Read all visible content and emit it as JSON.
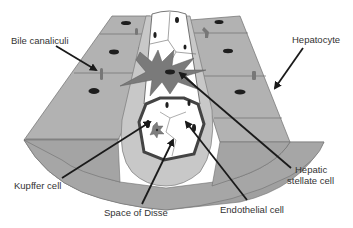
{
  "diagram": {
    "type": "anatomical-illustration",
    "colors": {
      "hepatocyte_fill": "#a8a8a8",
      "hepatocyte_top": "#b4b4b4",
      "hepatocyte_edge": "#6e6e6e",
      "space_of_disse": "#c8c8c8",
      "sinusoid_lumen": "#ffffff",
      "stellate_cell": "#7a7a7a",
      "nucleus": "#1e1e1e",
      "arrow": "#1a1a1a",
      "label_text": "#333333"
    },
    "labels": {
      "bile_canaliculi": "Bile canaliculi",
      "hepatocyte": "Hepatocyte",
      "hepatic_stellate_cell_line1": "Hepatic",
      "hepatic_stellate_cell_line2": "stellate cell",
      "kupffer_cell": "Kupffer cell",
      "space_of_disse": "Space of Disse",
      "endothelial_cell": "Endothelial cell"
    },
    "arrows": [
      {
        "from": "Bile canaliculi",
        "to": "bile canaliculus on left hepatocyte plate"
      },
      {
        "from": "Hepatocyte",
        "to": "right hepatocyte plate"
      },
      {
        "from": "Hepatic stellate cell",
        "to": "stellate cell in space of Disse"
      },
      {
        "from": "Kupffer cell",
        "to": "Kupffer cell inside sinusoid lumen"
      },
      {
        "from": "Space of Disse",
        "to": "gap between endothelium and hepatocytes"
      },
      {
        "from": "Endothelial cell",
        "to": "endothelial lining of sinusoid"
      }
    ]
  }
}
